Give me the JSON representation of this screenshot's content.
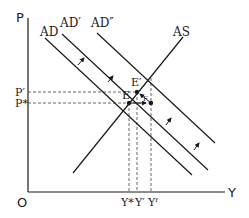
{
  "diagram": {
    "type": "AD-AS macroeconomic diagram",
    "axes": {
      "y_label": "P",
      "x_label": "Y",
      "origin_label": "O"
    },
    "curves": {
      "ad": "AD",
      "ad_prime": "AD′",
      "ad_double_prime": "AD″",
      "as": "AS"
    },
    "points": {
      "e": "E",
      "e_prime": "E′",
      "f": "F"
    },
    "price_levels": {
      "p_prime": "P′",
      "p_star": "P*"
    },
    "output_levels": {
      "y_star": "Y*",
      "y_prime": "Y′",
      "y_f": "Yᶠ"
    },
    "colors": {
      "line": "#1a1a1a",
      "dashed": "#555555",
      "background": "#ffffff"
    }
  }
}
